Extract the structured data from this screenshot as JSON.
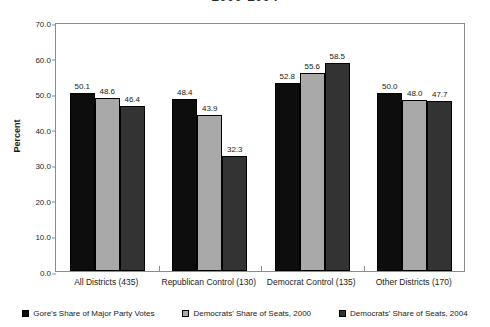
{
  "chart_data": {
    "type": "bar",
    "title": "2000-2004",
    "xlabel": "",
    "ylabel": "Percent",
    "ylim": [
      0,
      70
    ],
    "ytick_step": 10,
    "ytick_labels": [
      "70.0",
      "60.0",
      "50.0",
      "40.0",
      "30.0",
      "20.0",
      "10.0",
      "0.0"
    ],
    "grid": false,
    "legend_position": "bottom",
    "categories": [
      "All Districts (435)",
      "Republican Control (130)",
      "Democrat Control (135)",
      "Other Districts (170)"
    ],
    "series": [
      {
        "name": "Gore's Share of Major Party Votes",
        "color": "#0d0d0d",
        "values": [
          50.1,
          48.4,
          52.8,
          50.0
        ],
        "labels": [
          "50.1",
          "48.4",
          "52.8",
          "50.0"
        ]
      },
      {
        "name": "Democrats' Share of Seats, 2000",
        "color": "#a9a9a9",
        "values": [
          48.6,
          43.9,
          55.6,
          48.0
        ],
        "labels": [
          "48.6",
          "43.9",
          "55.6",
          "48.0"
        ]
      },
      {
        "name": "Democrats' Share of Seats, 2004",
        "color": "#333333",
        "values": [
          46.4,
          32.3,
          58.5,
          47.7
        ],
        "labels": [
          "46.4",
          "32.3",
          "58.5",
          "47.7"
        ]
      }
    ]
  }
}
